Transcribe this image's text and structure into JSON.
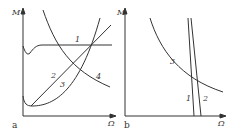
{
  "panels": [
    {
      "id": "a",
      "sublabel": "a",
      "ylabel": "M",
      "xlabel": "Ω",
      "curve_labels": [
        "1",
        "2",
        "3",
        "4"
      ]
    },
    {
      "id": "b",
      "sublabel": "b",
      "ylabel": "M",
      "xlabel": "Ω",
      "curve_labels": [
        "1",
        "2",
        "3"
      ]
    }
  ],
  "colors": {
    "line": "#333333",
    "background": "#ffffff"
  }
}
